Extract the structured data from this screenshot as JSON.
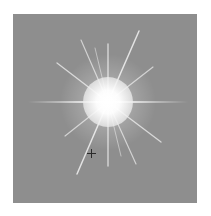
{
  "image": {
    "subject": "lens flare starburst on gray background",
    "background_color": "#8e8e8e",
    "glow_color": "#ffffff",
    "flare": {
      "center_x": 95,
      "center_y": 88,
      "disc_radius": 25,
      "ray_count": 12
    },
    "cursor": {
      "type": "crosshair",
      "x": 78,
      "y": 139
    },
    "caption": ""
  }
}
